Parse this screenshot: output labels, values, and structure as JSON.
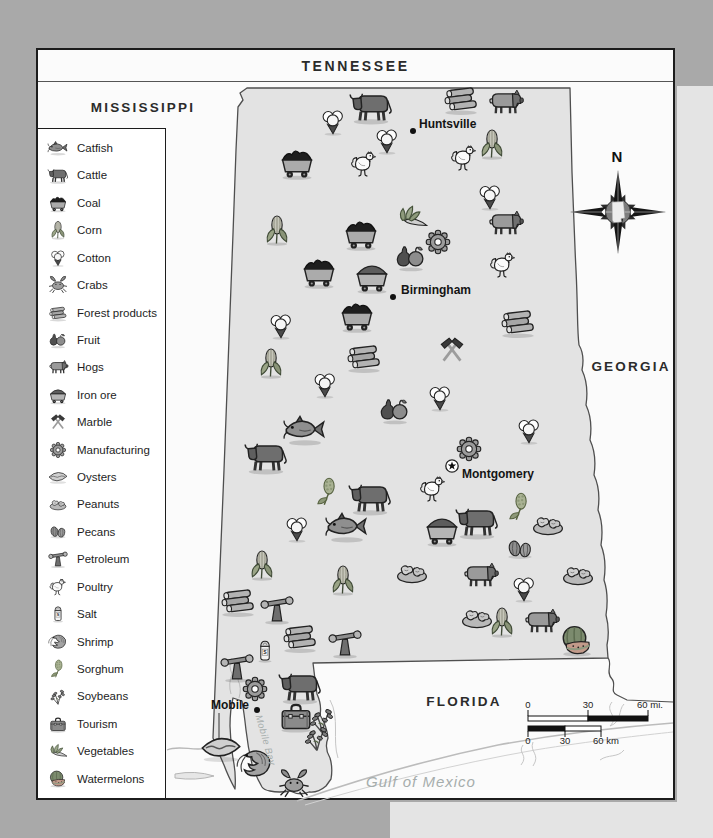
{
  "tennessee_band": {
    "label": "TENNESSEE"
  },
  "region_labels": [
    {
      "id": "mississippi",
      "text": "MISSISSIPPI",
      "x": 143,
      "y": 107,
      "cls": ""
    },
    {
      "id": "georgia",
      "text": "GEORGIA",
      "x": 631,
      "y": 366,
      "cls": ""
    },
    {
      "id": "florida",
      "text": "FLORIDA",
      "x": 464,
      "y": 701,
      "cls": ""
    },
    {
      "id": "gulf-of-mexico",
      "text": "Gulf of Mexico",
      "x": 421,
      "y": 781,
      "cls": "water"
    },
    {
      "id": "mobile-bay",
      "text": "Mobile Bay",
      "x": 266,
      "y": 740,
      "cls": "water-small",
      "rotate": 74
    }
  ],
  "cities": [
    {
      "name": "Huntsville",
      "x": 413,
      "y": 131,
      "marker": "dot",
      "label_x": 419,
      "label_y": 124,
      "align": "start"
    },
    {
      "name": "Birmingham",
      "x": 393,
      "y": 297,
      "marker": "dot",
      "label_x": 401,
      "label_y": 290,
      "align": "start"
    },
    {
      "name": "Montgomery",
      "x": 452,
      "y": 466,
      "marker": "star",
      "label_x": 462,
      "label_y": 474,
      "align": "start"
    },
    {
      "name": "Mobile",
      "x": 257,
      "y": 710,
      "marker": "dot",
      "label_x": 249,
      "label_y": 705,
      "align": "end"
    }
  ],
  "legend": {
    "items": [
      {
        "id": "catfish",
        "label": "Catfish"
      },
      {
        "id": "cattle",
        "label": "Cattle"
      },
      {
        "id": "coal",
        "label": "Coal"
      },
      {
        "id": "corn",
        "label": "Corn"
      },
      {
        "id": "cotton",
        "label": "Cotton"
      },
      {
        "id": "crabs",
        "label": "Crabs"
      },
      {
        "id": "forest",
        "label": "Forest products"
      },
      {
        "id": "fruit",
        "label": "Fruit"
      },
      {
        "id": "hogs",
        "label": "Hogs"
      },
      {
        "id": "iron-ore",
        "label": "Iron ore"
      },
      {
        "id": "marble",
        "label": "Marble"
      },
      {
        "id": "manufacturing",
        "label": "Manufacturing"
      },
      {
        "id": "oysters",
        "label": "Oysters"
      },
      {
        "id": "peanuts",
        "label": "Peanuts"
      },
      {
        "id": "pecans",
        "label": "Pecans"
      },
      {
        "id": "petroleum",
        "label": "Petroleum"
      },
      {
        "id": "poultry",
        "label": "Poultry"
      },
      {
        "id": "salt",
        "label": "Salt"
      },
      {
        "id": "shrimp",
        "label": "Shrimp"
      },
      {
        "id": "sorghum",
        "label": "Sorghum"
      },
      {
        "id": "soybeans",
        "label": "Soybeans"
      },
      {
        "id": "tourism",
        "label": "Tourism"
      },
      {
        "id": "vegetables",
        "label": "Vegetables"
      },
      {
        "id": "watermelons",
        "label": "Watermelons"
      }
    ]
  },
  "compass": {
    "north_label": "N"
  },
  "scale_bar": {
    "mi_y": 699,
    "mi_ticks": [
      {
        "label": "0",
        "x": 528
      },
      {
        "label": "30",
        "x": 588
      },
      {
        "label": "60 mi.",
        "x": 650
      }
    ],
    "km_y": 735,
    "km_ticks": [
      {
        "label": "0",
        "x": 528
      },
      {
        "label": "30",
        "x": 565
      },
      {
        "label": "60 km",
        "x": 606
      }
    ]
  },
  "icons_meta": {
    "salt_letter": "S"
  },
  "map_icons": [
    {
      "t": "cattle",
      "x": 371,
      "y": 106,
      "s": 46
    },
    {
      "t": "cotton",
      "x": 333,
      "y": 122,
      "s": 34
    },
    {
      "t": "forest",
      "x": 461,
      "y": 99,
      "s": 42
    },
    {
      "t": "hogs",
      "x": 505,
      "y": 102,
      "s": 40
    },
    {
      "t": "cotton",
      "x": 387,
      "y": 141,
      "s": 34
    },
    {
      "t": "corn",
      "x": 492,
      "y": 144,
      "s": 36
    },
    {
      "t": "poultry",
      "x": 464,
      "y": 158,
      "s": 34
    },
    {
      "t": "poultry",
      "x": 364,
      "y": 164,
      "s": 34
    },
    {
      "t": "coal",
      "x": 297,
      "y": 162,
      "s": 42
    },
    {
      "t": "cotton",
      "x": 490,
      "y": 197,
      "s": 34
    },
    {
      "t": "vegetables",
      "x": 412,
      "y": 217,
      "s": 36
    },
    {
      "t": "hogs",
      "x": 505,
      "y": 223,
      "s": 40
    },
    {
      "t": "corn",
      "x": 277,
      "y": 230,
      "s": 36
    },
    {
      "t": "coal",
      "x": 361,
      "y": 233,
      "s": 42
    },
    {
      "t": "manufacturing",
      "x": 438,
      "y": 242,
      "s": 34
    },
    {
      "t": "fruit",
      "x": 411,
      "y": 257,
      "s": 38
    },
    {
      "t": "poultry",
      "x": 503,
      "y": 265,
      "s": 34
    },
    {
      "t": "coal",
      "x": 319,
      "y": 271,
      "s": 42
    },
    {
      "t": "iron-ore",
      "x": 372,
      "y": 276,
      "s": 42
    },
    {
      "t": "coal",
      "x": 357,
      "y": 315,
      "s": 42
    },
    {
      "t": "cotton",
      "x": 281,
      "y": 326,
      "s": 34
    },
    {
      "t": "forest",
      "x": 518,
      "y": 322,
      "s": 42
    },
    {
      "t": "forest",
      "x": 364,
      "y": 357,
      "s": 42
    },
    {
      "t": "marble",
      "x": 452,
      "y": 350,
      "s": 36
    },
    {
      "t": "corn",
      "x": 271,
      "y": 363,
      "s": 36
    },
    {
      "t": "cotton",
      "x": 325,
      "y": 385,
      "s": 34
    },
    {
      "t": "cotton",
      "x": 440,
      "y": 398,
      "s": 34
    },
    {
      "t": "fruit",
      "x": 395,
      "y": 410,
      "s": 38
    },
    {
      "t": "catfish",
      "x": 305,
      "y": 430,
      "s": 46
    },
    {
      "t": "cotton",
      "x": 529,
      "y": 431,
      "s": 34
    },
    {
      "t": "manufacturing",
      "x": 469,
      "y": 449,
      "s": 34
    },
    {
      "t": "cattle",
      "x": 266,
      "y": 456,
      "s": 46
    },
    {
      "t": "poultry",
      "x": 433,
      "y": 489,
      "s": 34
    },
    {
      "t": "sorghum",
      "x": 328,
      "y": 492,
      "s": 34
    },
    {
      "t": "cattle",
      "x": 370,
      "y": 497,
      "s": 46
    },
    {
      "t": "sorghum",
      "x": 520,
      "y": 507,
      "s": 34
    },
    {
      "t": "catfish",
      "x": 347,
      "y": 527,
      "s": 46
    },
    {
      "t": "iron-ore",
      "x": 442,
      "y": 529,
      "s": 42
    },
    {
      "t": "cattle",
      "x": 477,
      "y": 521,
      "s": 46
    },
    {
      "t": "peanuts",
      "x": 548,
      "y": 524,
      "s": 40
    },
    {
      "t": "cotton",
      "x": 297,
      "y": 529,
      "s": 34
    },
    {
      "t": "pecans",
      "x": 520,
      "y": 549,
      "s": 34
    },
    {
      "t": "corn",
      "x": 262,
      "y": 565,
      "s": 36
    },
    {
      "t": "peanuts",
      "x": 412,
      "y": 572,
      "s": 40
    },
    {
      "t": "hogs",
      "x": 480,
      "y": 575,
      "s": 40
    },
    {
      "t": "peanuts",
      "x": 578,
      "y": 574,
      "s": 40
    },
    {
      "t": "corn",
      "x": 343,
      "y": 580,
      "s": 36
    },
    {
      "t": "cotton",
      "x": 524,
      "y": 589,
      "s": 34
    },
    {
      "t": "forest",
      "x": 238,
      "y": 601,
      "s": 42
    },
    {
      "t": "petroleum",
      "x": 277,
      "y": 609,
      "s": 38
    },
    {
      "t": "peanuts",
      "x": 477,
      "y": 617,
      "s": 40
    },
    {
      "t": "corn",
      "x": 502,
      "y": 622,
      "s": 36
    },
    {
      "t": "hogs",
      "x": 541,
      "y": 621,
      "s": 40
    },
    {
      "t": "forest",
      "x": 300,
      "y": 637,
      "s": 42
    },
    {
      "t": "watermelons",
      "x": 577,
      "y": 641,
      "s": 40
    },
    {
      "t": "petroleum",
      "x": 345,
      "y": 643,
      "s": 38
    },
    {
      "t": "salt",
      "x": 265,
      "y": 651,
      "s": 30
    },
    {
      "t": "petroleum",
      "x": 237,
      "y": 667,
      "s": 38
    },
    {
      "t": "manufacturing",
      "x": 255,
      "y": 689,
      "s": 34
    },
    {
      "t": "cattle",
      "x": 300,
      "y": 686,
      "s": 46
    },
    {
      "t": "tourism",
      "x": 296,
      "y": 716,
      "s": 42
    },
    {
      "t": "soybeans",
      "x": 322,
      "y": 719,
      "s": 36
    },
    {
      "t": "soybeans",
      "x": 317,
      "y": 737,
      "s": 36
    },
    {
      "t": "oysters",
      "x": 221,
      "y": 748,
      "s": 46
    },
    {
      "t": "shrimp",
      "x": 255,
      "y": 764,
      "s": 42
    },
    {
      "t": "crabs",
      "x": 294,
      "y": 784,
      "s": 36
    }
  ]
}
